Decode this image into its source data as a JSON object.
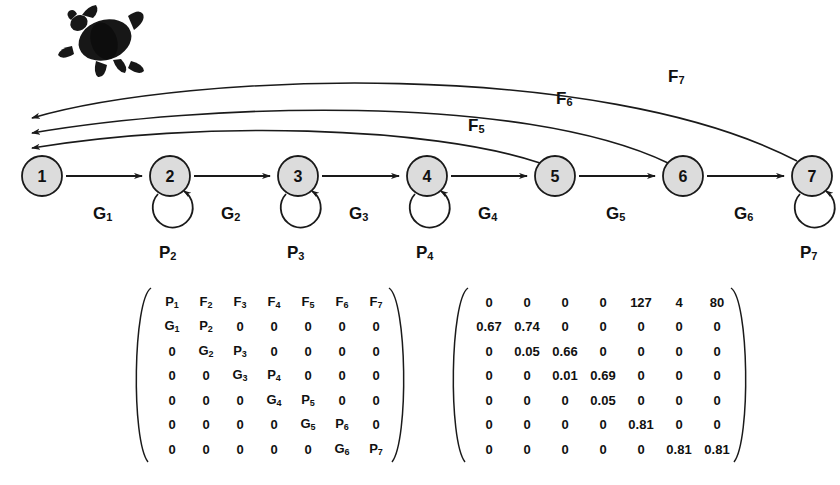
{
  "figure": {
    "organism_icon": "sea-turtle-icon",
    "node_fill": "#dcdcdc",
    "node_stroke": "#1a1a1a",
    "line_color": "#1a1a1a"
  },
  "lifecycle": {
    "nodes": [
      {
        "id": "1",
        "label": "1",
        "cx": 42,
        "cy": 176,
        "self_loop": false,
        "loop_label": ""
      },
      {
        "id": "2",
        "label": "2",
        "cx": 170,
        "cy": 176,
        "self_loop": true,
        "loop_label": "P2"
      },
      {
        "id": "3",
        "label": "3",
        "cx": 298,
        "cy": 176,
        "self_loop": true,
        "loop_label": "P3"
      },
      {
        "id": "4",
        "label": "4",
        "cx": 427,
        "cy": 176,
        "self_loop": true,
        "loop_label": "P4"
      },
      {
        "id": "5",
        "label": "5",
        "cx": 555,
        "cy": 176,
        "self_loop": false,
        "loop_label": ""
      },
      {
        "id": "6",
        "label": "6",
        "cx": 683,
        "cy": 176,
        "self_loop": false,
        "loop_label": ""
      },
      {
        "id": "7",
        "label": "7",
        "cx": 812,
        "cy": 176,
        "self_loop": true,
        "loop_label": "P7"
      }
    ],
    "growth_labels": [
      {
        "text": "G",
        "sub": "1",
        "x": 93,
        "y": 204
      },
      {
        "text": "G",
        "sub": "2",
        "x": 221,
        "y": 204
      },
      {
        "text": "G",
        "sub": "3",
        "x": 349,
        "y": 204
      },
      {
        "text": "G",
        "sub": "4",
        "x": 478,
        "y": 204
      },
      {
        "text": "G",
        "sub": "5",
        "x": 606,
        "y": 204
      },
      {
        "text": "G",
        "sub": "6",
        "x": 734,
        "y": 204
      }
    ],
    "persistence_labels": [
      {
        "text": "P",
        "sub": "2",
        "x": 159,
        "y": 243
      },
      {
        "text": "P",
        "sub": "3",
        "x": 287,
        "y": 243
      },
      {
        "text": "P",
        "sub": "4",
        "x": 416,
        "y": 243
      },
      {
        "text": "P",
        "sub": "7",
        "x": 800,
        "y": 243
      }
    ],
    "fecundity_labels": [
      {
        "text": "F",
        "sub": "5",
        "x": 468,
        "y": 116
      },
      {
        "text": "F",
        "sub": "6",
        "x": 556,
        "y": 89
      },
      {
        "text": "F",
        "sub": "7",
        "x": 668,
        "y": 67
      }
    ]
  },
  "matrix_symbolic": {
    "rows": [
      [
        "P1",
        "F2",
        "F3",
        "F4",
        "F5",
        "F6",
        "F7"
      ],
      [
        "G1",
        "P2",
        "0",
        "0",
        "0",
        "0",
        "0"
      ],
      [
        "0",
        "G2",
        "P3",
        "0",
        "0",
        "0",
        "0"
      ],
      [
        "0",
        "0",
        "G3",
        "P4",
        "0",
        "0",
        "0"
      ],
      [
        "0",
        "0",
        "0",
        "G4",
        "P5",
        "0",
        "0"
      ],
      [
        "0",
        "0",
        "0",
        "0",
        "G5",
        "P6",
        "0"
      ],
      [
        "0",
        "0",
        "0",
        "0",
        "0",
        "G6",
        "P7"
      ]
    ]
  },
  "matrix_numeric": {
    "rows": [
      [
        "0",
        "0",
        "0",
        "0",
        "127",
        "4",
        "80"
      ],
      [
        "0.67",
        "0.74",
        "0",
        "0",
        "0",
        "0",
        "0"
      ],
      [
        "0",
        "0.05",
        "0.66",
        "0",
        "0",
        "0",
        "0"
      ],
      [
        "0",
        "0",
        "0.01",
        "0.69",
        "0",
        "0",
        "0"
      ],
      [
        "0",
        "0",
        "0",
        "0.05",
        "0",
        "0",
        "0"
      ],
      [
        "0",
        "0",
        "0",
        "0",
        "0.81",
        "0",
        "0"
      ],
      [
        "0",
        "0",
        "0",
        "0",
        "0",
        "0.81",
        "0.81"
      ]
    ]
  }
}
